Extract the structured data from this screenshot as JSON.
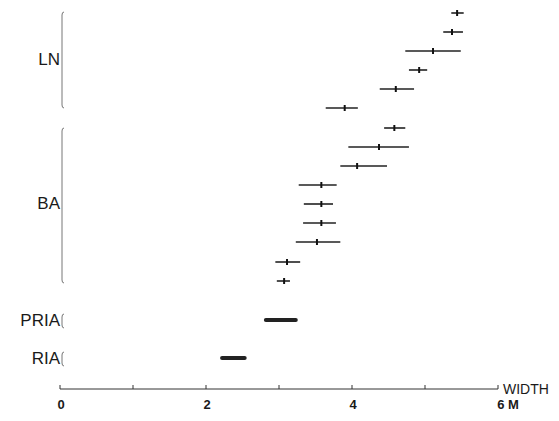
{
  "chart_data": {
    "type": "range-bar",
    "title": "",
    "xlabel": "WIDTH",
    "xunit": "M",
    "xlim": [
      0,
      6
    ],
    "xticks_major": [
      0,
      2,
      4,
      6
    ],
    "xticks_minor": [
      1,
      3,
      5
    ],
    "tick_labels": [
      "0",
      "2",
      "4",
      "6"
    ],
    "grid": false,
    "groups": [
      {
        "name": "LN",
        "items": [
          {
            "low": 5.36,
            "high": 5.53,
            "center": 5.44
          },
          {
            "low": 5.25,
            "high": 5.52,
            "center": 5.37
          },
          {
            "low": 4.73,
            "high": 5.49,
            "center": 5.11
          },
          {
            "low": 4.78,
            "high": 5.03,
            "center": 4.92
          },
          {
            "low": 4.38,
            "high": 4.85,
            "center": 4.6
          },
          {
            "low": 3.64,
            "high": 4.08,
            "center": 3.9
          }
        ]
      },
      {
        "name": "BA",
        "items": [
          {
            "low": 4.44,
            "high": 4.73,
            "center": 4.58
          },
          {
            "low": 3.95,
            "high": 4.78,
            "center": 4.37
          },
          {
            "low": 3.84,
            "high": 4.48,
            "center": 4.07
          },
          {
            "low": 3.27,
            "high": 3.79,
            "center": 3.58
          },
          {
            "low": 3.34,
            "high": 3.74,
            "center": 3.58
          },
          {
            "low": 3.33,
            "high": 3.78,
            "center": 3.58
          },
          {
            "low": 3.23,
            "high": 3.84,
            "center": 3.52
          },
          {
            "low": 2.95,
            "high": 3.29,
            "center": 3.11
          },
          {
            "low": 2.97,
            "high": 3.15,
            "center": 3.07
          }
        ]
      },
      {
        "name": "PRIA",
        "items": [
          {
            "low": 2.82,
            "high": 3.23,
            "center": null
          }
        ]
      },
      {
        "name": "RIA",
        "items": [
          {
            "low": 2.22,
            "high": 2.53,
            "center": null
          }
        ]
      }
    ]
  },
  "labels": {
    "group_ln": "LN",
    "group_ba": "BA",
    "group_pria": "PRIA",
    "group_ria": "RIA",
    "axis_title": "WIDTH",
    "tick_0": "0",
    "tick_2": "2",
    "tick_4": "4",
    "tick_6": "6 M"
  }
}
